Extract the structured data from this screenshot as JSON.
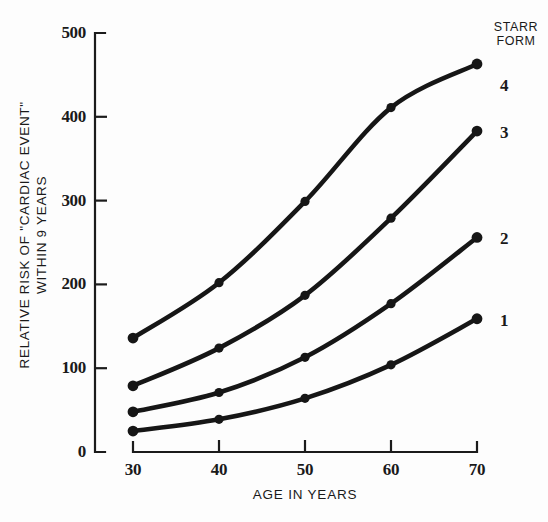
{
  "chart_data": {
    "type": "line",
    "title": "",
    "xlabel": "AGE IN YEARS",
    "ylabel_line1": "RELATIVE RISK OF \"CARDIAC EVENT\"",
    "ylabel_line2": "WITHIN 9 YEARS",
    "legend_title_line1": "STARR",
    "legend_title_line2": "FORM",
    "legend_position": "right",
    "grid": false,
    "x": [
      30,
      40,
      50,
      60,
      70
    ],
    "xtick_labels": [
      "30",
      "40",
      "50",
      "60",
      "70"
    ],
    "ytick_labels": [
      "0",
      "100",
      "200",
      "300",
      "400",
      "500"
    ],
    "ytick_values": [
      0,
      100,
      200,
      300,
      400,
      500
    ],
    "xlim": [
      30,
      70
    ],
    "ylim": [
      0,
      500
    ],
    "marker": "filled-circle",
    "line_color": "#161616",
    "series": [
      {
        "name": "4",
        "label": "4",
        "values": [
          136,
          202,
          299,
          411,
          463
        ]
      },
      {
        "name": "3",
        "label": "3",
        "values": [
          79,
          124,
          187,
          279,
          383
        ]
      },
      {
        "name": "2",
        "label": "2",
        "values": [
          48,
          71,
          113,
          177,
          256
        ]
      },
      {
        "name": "1",
        "label": "1",
        "values": [
          25,
          39,
          64,
          104,
          159
        ]
      }
    ]
  }
}
